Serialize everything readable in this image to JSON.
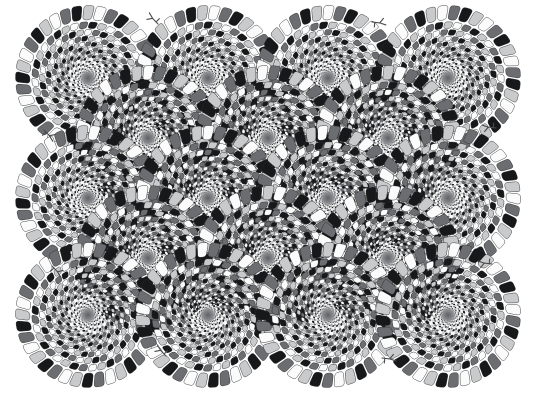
{
  "figure": {
    "name": "rotating-snakes",
    "subtitle": "Peripheral drift illusion",
    "illusion_type": "peripheral-drift",
    "canvas": {
      "width": 536,
      "height": 397
    },
    "background_color": "#ffffff",
    "alt_text": "A white field filled with overlapping circular discs; each disc is built from concentric rings of small tilted rounded bars cycling black, light gray, white, dark gray, producing an illusory rotation."
  },
  "palette": {
    "background": "#ffffff",
    "black": "#17181a",
    "dark_gray": "#6b6d70",
    "white": "#fbfbfb",
    "light_gray": "#c9cacb",
    "center_dot": "#5f6165",
    "center_dot_edge": "#8a8c8f",
    "outline": "#2a2b2d",
    "tail_stroke": "#4a4c4f"
  },
  "disc_geometry": {
    "outer_radius": 74,
    "inner_radius": 3.0,
    "ring_count": 17,
    "segments_per_ring": 36,
    "ring_radius_growth": 1.1585,
    "segment_tilt_degrees": 17,
    "segment_gap_fraction": 0.16,
    "ring_angle_offset_degrees": 5.0,
    "segment_corner_rounding": 0.3,
    "center_dot_radius": 4.5,
    "color_cycle": [
      "black",
      "light_gray",
      "white",
      "dark_gray"
    ]
  },
  "grid": {
    "columns_even_row": 4,
    "columns_odd_row": 3,
    "even_row_x": [
      88,
      208,
      328,
      448
    ],
    "odd_row_x": [
      148,
      268,
      388
    ],
    "row_y": [
      78,
      138,
      198,
      258,
      315
    ],
    "row_parity": [
      "even",
      "odd",
      "even",
      "odd",
      "even"
    ],
    "total_discs": 18
  },
  "discs": [
    {
      "id": "disc-r1-c1",
      "cx": 88,
      "cy": 78,
      "row": 1,
      "col": 1,
      "phase": 0
    },
    {
      "id": "disc-r1-c2",
      "cx": 208,
      "cy": 78,
      "row": 1,
      "col": 2,
      "phase": 1
    },
    {
      "id": "disc-r1-c3",
      "cx": 328,
      "cy": 78,
      "row": 1,
      "col": 3,
      "phase": 2
    },
    {
      "id": "disc-r1-c4",
      "cx": 448,
      "cy": 78,
      "row": 1,
      "col": 4,
      "phase": 3
    },
    {
      "id": "disc-r2-c1",
      "cx": 148,
      "cy": 138,
      "row": 2,
      "col": 1,
      "phase": 2
    },
    {
      "id": "disc-r2-c2",
      "cx": 268,
      "cy": 138,
      "row": 2,
      "col": 2,
      "phase": 3
    },
    {
      "id": "disc-r2-c3",
      "cx": 388,
      "cy": 138,
      "row": 2,
      "col": 3,
      "phase": 0
    },
    {
      "id": "disc-r3-c1",
      "cx": 88,
      "cy": 198,
      "row": 3,
      "col": 1,
      "phase": 1
    },
    {
      "id": "disc-r3-c2",
      "cx": 208,
      "cy": 198,
      "row": 3,
      "col": 2,
      "phase": 2
    },
    {
      "id": "disc-r3-c3",
      "cx": 328,
      "cy": 198,
      "row": 3,
      "col": 3,
      "phase": 3
    },
    {
      "id": "disc-r3-c4",
      "cx": 448,
      "cy": 198,
      "row": 3,
      "col": 4,
      "phase": 0
    },
    {
      "id": "disc-r4-c1",
      "cx": 148,
      "cy": 258,
      "row": 4,
      "col": 1,
      "phase": 3
    },
    {
      "id": "disc-r4-c2",
      "cx": 268,
      "cy": 258,
      "row": 4,
      "col": 2,
      "phase": 0
    },
    {
      "id": "disc-r4-c3",
      "cx": 388,
      "cy": 258,
      "row": 4,
      "col": 3,
      "phase": 1
    },
    {
      "id": "disc-r5-c1",
      "cx": 88,
      "cy": 315,
      "row": 5,
      "col": 1,
      "phase": 2
    },
    {
      "id": "disc-r5-c2",
      "cx": 208,
      "cy": 315,
      "row": 5,
      "col": 2,
      "phase": 3
    },
    {
      "id": "disc-r5-c3",
      "cx": 328,
      "cy": 315,
      "row": 5,
      "col": 3,
      "phase": 0
    },
    {
      "id": "disc-r5-c4",
      "cx": 448,
      "cy": 315,
      "row": 5,
      "col": 4,
      "phase": 1
    }
  ],
  "tails": [
    {
      "id": "tail-top-left",
      "x": 158,
      "y": 24,
      "rotation": 200
    },
    {
      "id": "tail-top-right",
      "x": 372,
      "y": 22,
      "rotation": 340
    },
    {
      "id": "tail-left-upper",
      "x": 44,
      "y": 130,
      "rotation": 20
    },
    {
      "id": "tail-right-upper",
      "x": 496,
      "y": 128,
      "rotation": 160
    },
    {
      "id": "tail-left-lower",
      "x": 52,
      "y": 266,
      "rotation": 20
    },
    {
      "id": "tail-right-lower",
      "x": 492,
      "y": 264,
      "rotation": 160
    },
    {
      "id": "tail-bottom-left",
      "x": 166,
      "y": 356,
      "rotation": 200
    },
    {
      "id": "tail-bottom-right",
      "x": 382,
      "y": 358,
      "rotation": 340
    }
  ]
}
